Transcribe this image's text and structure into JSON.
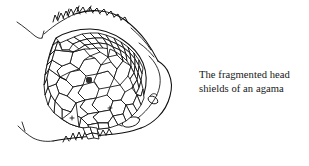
{
  "figure": {
    "style": "pen-and-ink line drawing",
    "background_color": "#ffffff",
    "ink_color": "#0d0d0d"
  },
  "caption": {
    "line_1": "The fragmented head",
    "line_2": "shields of an agama",
    "full_text": "The fragmented head shields of an agama",
    "text_color": "#161616"
  },
  "illustration": {
    "head_outline_label": "lizard head profile outline",
    "crest_label": "spiny dorsal crest scales",
    "lower_jaw_label": "lower jaw spiny scale row",
    "nostril_label": "nostril oval",
    "ear_label": "ear opening oval",
    "shield_mosaic_label": "fragmented head shield mosaic",
    "neck_line_label": "neck contour line"
  }
}
